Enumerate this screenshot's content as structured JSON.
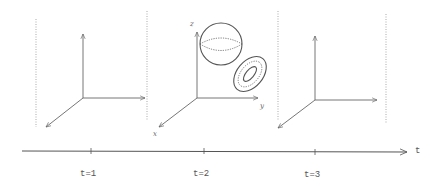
{
  "diagram": {
    "frames": [
      {
        "id": "frame-1",
        "origin": [
          83,
          98
        ],
        "objects": []
      },
      {
        "id": "frame-2",
        "origin": [
          197,
          98
        ],
        "objects": [
          "sphere",
          "torus"
        ],
        "axis_labels": {
          "x": "x",
          "y": "y",
          "z": "z"
        }
      },
      {
        "id": "frame-3",
        "origin": [
          315,
          100
        ],
        "objects": []
      }
    ],
    "axis_labels": {
      "x": "x",
      "y": "y",
      "z": "z"
    },
    "time_axis": {
      "label": "t",
      "ticks": [
        {
          "label": "t=1",
          "x": 91
        },
        {
          "label": "t=2",
          "x": 204
        },
        {
          "label": "t=3",
          "x": 315
        }
      ]
    }
  }
}
